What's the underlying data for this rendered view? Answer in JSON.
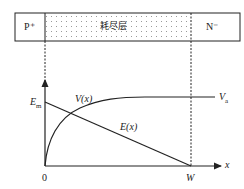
{
  "diagram": {
    "type": "pn-junction-depletion",
    "regions": {
      "left": "P⁺",
      "middle": "耗尽层",
      "right": "N⁻"
    },
    "axes": {
      "origin_label": "0",
      "x_label": "x",
      "w_label": "W"
    },
    "curves": {
      "potential_label": "V(x)",
      "field_label": "E(x)",
      "em_label": "E",
      "em_sub": "m",
      "va_label": "V",
      "va_sub": "a"
    },
    "colors": {
      "line": "#222222",
      "dots": "#888888",
      "background": "#ffffff"
    }
  }
}
